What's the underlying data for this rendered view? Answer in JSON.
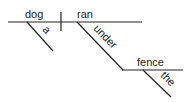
{
  "diagram": {
    "type": "sentence-diagram",
    "subject": "dog",
    "verb": "ran",
    "subject_modifier": "a",
    "preposition": "under",
    "prepositional_object": "fence",
    "object_modifier": "the",
    "line_color": "#222222"
  }
}
